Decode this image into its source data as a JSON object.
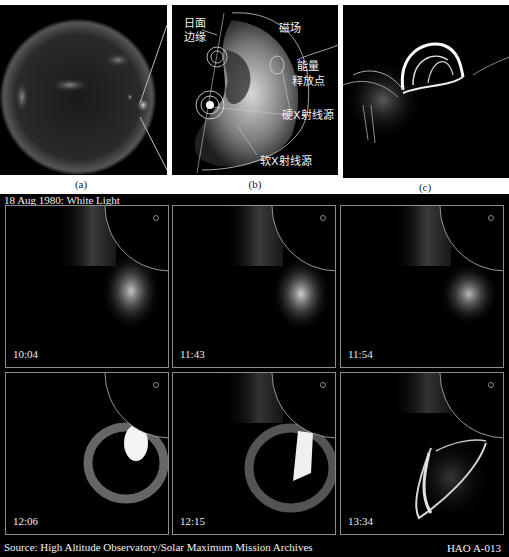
{
  "top_panels": [
    {
      "id": "a",
      "caption": "(a)",
      "description": "soft X-ray full solar disk image"
    },
    {
      "id": "b",
      "caption": "(b)",
      "description": "flare loop schematic",
      "annotations": {
        "solar_limb": [
          "日面",
          "边缘"
        ],
        "magnetic_field": "磁场",
        "energy_release_point": [
          "能量",
          "释放点"
        ],
        "hard_xray_source": "硬X射线源",
        "soft_xray_source": "软X射线源"
      }
    },
    {
      "id": "c",
      "caption": "(c)",
      "description": "coronal loops over active region"
    }
  ],
  "sequence": {
    "title": "18 Aug 1980:  White Light",
    "frames": [
      {
        "time": "10:04"
      },
      {
        "time": "11:43"
      },
      {
        "time": "11:54"
      },
      {
        "time": "12:06"
      },
      {
        "time": "12:15"
      },
      {
        "time": "13:34"
      }
    ],
    "source": "Source:  High Altitude Observatory/Solar Maximum Mission Archives",
    "id_label": "HAO A-013"
  }
}
